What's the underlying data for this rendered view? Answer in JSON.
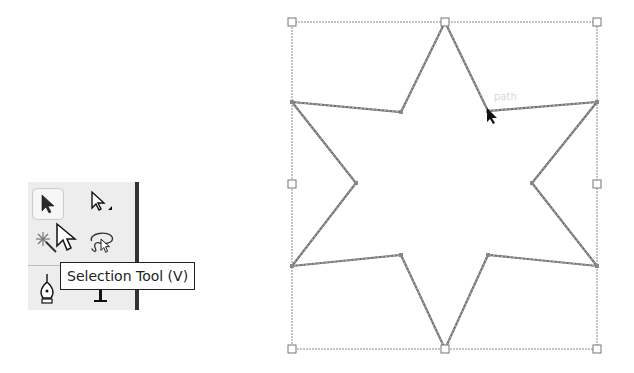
{
  "toolbox": {
    "tools": [
      {
        "name": "selection-tool",
        "active": true
      },
      {
        "name": "direct-selection-tool",
        "active": false
      },
      {
        "name": "magic-wand-tool",
        "active": false
      },
      {
        "name": "lasso-tool",
        "active": false
      },
      {
        "name": "pen-tool",
        "active": false
      },
      {
        "name": "type-tool",
        "active": false
      }
    ],
    "tooltip": "Selection Tool (V)"
  },
  "canvas": {
    "hover_label": "path",
    "shape": "six-pointed-star",
    "stroke_color": "#7a7a7a",
    "bounding_box": {
      "x": 292,
      "y": 22,
      "width": 305,
      "height": 327
    },
    "star_points": [
      [
        445,
        22
      ],
      [
        488,
        111
      ],
      [
        597,
        102
      ],
      [
        532,
        183
      ],
      [
        597,
        266
      ],
      [
        488,
        255
      ],
      [
        445,
        349
      ],
      [
        401,
        255
      ],
      [
        292,
        266
      ],
      [
        356,
        183
      ],
      [
        292,
        102
      ],
      [
        401,
        112
      ]
    ],
    "bbox_handles": [
      [
        292,
        22
      ],
      [
        445,
        22
      ],
      [
        597,
        22
      ],
      [
        292,
        184
      ],
      [
        597,
        184
      ],
      [
        292,
        349
      ],
      [
        445,
        349
      ],
      [
        597,
        349
      ]
    ]
  }
}
